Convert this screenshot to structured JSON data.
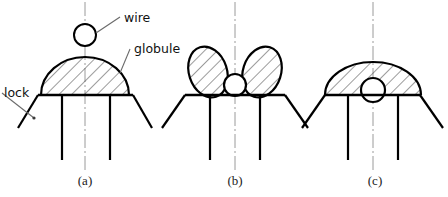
{
  "figure": {
    "title": "",
    "background_color": "#ffffff",
    "line_color": "#000000",
    "hatch_color": "#3a3a3a",
    "centerline_color": "#8a8a8a",
    "labels": {
      "wire": "wire",
      "globule": "globule",
      "lock": "lock"
    },
    "captions": {
      "a": "(a)",
      "b": "(b)",
      "c": "(c)"
    }
  },
  "panels": [
    {
      "id": "a",
      "caption": "(a)",
      "caption_x": 85,
      "caption_y": 185,
      "centerline_x": 85,
      "base_y": 95,
      "base_left_x": 38,
      "base_right_x": 133,
      "leg_left_x": 62,
      "leg_right_x": 110,
      "leg_bottom_y": 160,
      "flare_left_x": 18,
      "flare_right_x": 152,
      "flare_y": 128,
      "globule": {
        "shape": "dome",
        "cx": 85,
        "cy": 95,
        "rx": 44,
        "ry": 38,
        "hatched": true
      },
      "wire_circle": {
        "cx": 85,
        "cy": 35,
        "r": 11,
        "hatched": false
      },
      "small_circle": null
    },
    {
      "id": "b",
      "caption": "(b)",
      "caption_x": 235,
      "caption_y": 185,
      "centerline_x": 235,
      "base_y": 95,
      "base_left_x": 185,
      "base_right_x": 285,
      "leg_left_x": 210,
      "leg_right_x": 260,
      "leg_bottom_y": 160,
      "flare_left_x": 162,
      "flare_right_x": 308,
      "flare_y": 128,
      "globule": {
        "shape": "split-lobes",
        "lobe_left_cx": 208,
        "lobe_right_cx": 262,
        "lobe_cy": 72,
        "lobe_rx": 19,
        "lobe_ry": 26,
        "lobe_tilt_deg": 18,
        "hatched": true
      },
      "wire_circle": null,
      "small_circle": {
        "cx": 235,
        "cy": 85,
        "r": 11,
        "hatched": false
      }
    },
    {
      "id": "c",
      "caption": "(c)",
      "caption_x": 375,
      "caption_y": 185,
      "centerline_x": 373,
      "base_y": 95,
      "base_left_x": 325,
      "base_right_x": 420,
      "leg_left_x": 348,
      "leg_right_x": 398,
      "leg_bottom_y": 160,
      "flare_left_x": 302,
      "flare_right_x": 443,
      "flare_y": 128,
      "globule": {
        "shape": "flattened-dome",
        "cx": 373,
        "cy": 95,
        "rx": 48,
        "ry": 33,
        "hatched": true
      },
      "wire_circle": null,
      "small_circle": {
        "cx": 373,
        "cy": 90,
        "r": 12,
        "hatched": false
      }
    }
  ],
  "annotations": [
    {
      "name": "wire",
      "text": "wire",
      "text_x": 124,
      "text_y": 22,
      "leader_from_x": 96,
      "leader_from_y": 33,
      "leader_to_x": 120,
      "leader_to_y": 17
    },
    {
      "name": "globule",
      "text": "globule",
      "text_x": 134,
      "text_y": 53,
      "leader_from_x": 120,
      "leader_from_y": 73,
      "leader_to_x": 130,
      "leader_to_y": 49
    },
    {
      "name": "lock",
      "text": "lock",
      "text_x": 4,
      "text_y": 97,
      "leader_from_x": 34,
      "leader_from_y": 118,
      "leader_to_x": 2,
      "leader_to_y": 93
    }
  ]
}
